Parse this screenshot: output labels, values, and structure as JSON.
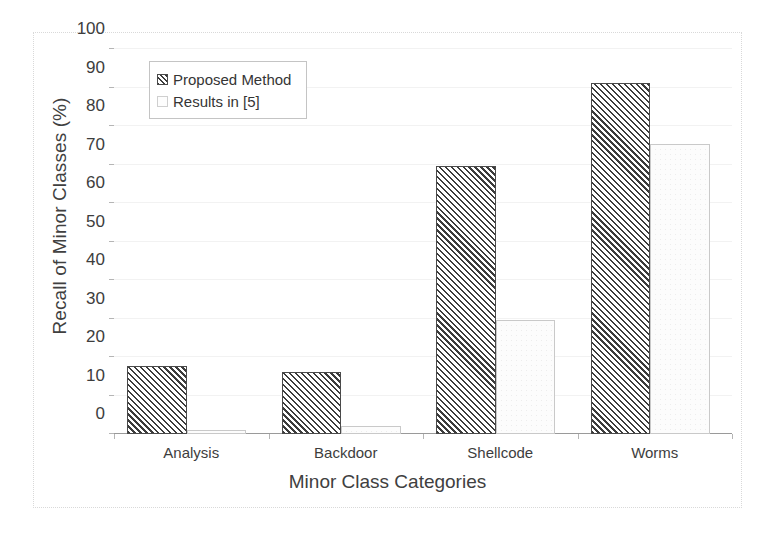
{
  "chart_data": {
    "type": "bar",
    "title": "",
    "xlabel": "Minor Class Categories",
    "ylabel": "Recall of Minor Classes (%)",
    "categories": [
      "Analysis",
      "Backdoor",
      "Shellcode",
      "Worms"
    ],
    "series": [
      {
        "name": "Proposed Method",
        "values": [
          17.7,
          16.1,
          69.5,
          91.2
        ],
        "fill": "diagonal-hatch"
      },
      {
        "name": "Results in [5]",
        "values": [
          1.0,
          2.0,
          29.5,
          75.3
        ],
        "fill": "light-dots"
      }
    ],
    "ylim": [
      0,
      100
    ],
    "yticks": [
      0,
      10,
      20,
      30,
      40,
      50,
      60,
      70,
      80,
      90,
      100
    ],
    "ytick_labels": [
      "0",
      "10",
      "20",
      "30",
      "40",
      "50",
      "60",
      "70",
      "80",
      "90",
      "100"
    ],
    "grid": true,
    "legend_position": "top-left",
    "legend_entries": [
      "Proposed Method",
      "Results in [5]"
    ]
  },
  "colors": {
    "hatch_line": "#3c3c3c",
    "bar_border": "#4a4a4a",
    "dots_fill": "#fcfcfc",
    "dots_border": "#c9c9c9",
    "gridline": "#f2f2f2",
    "axis": "#9a9a9a",
    "text": "#3d3d3d",
    "figure_border": "#d9d9d9",
    "background": "#ffffff"
  }
}
